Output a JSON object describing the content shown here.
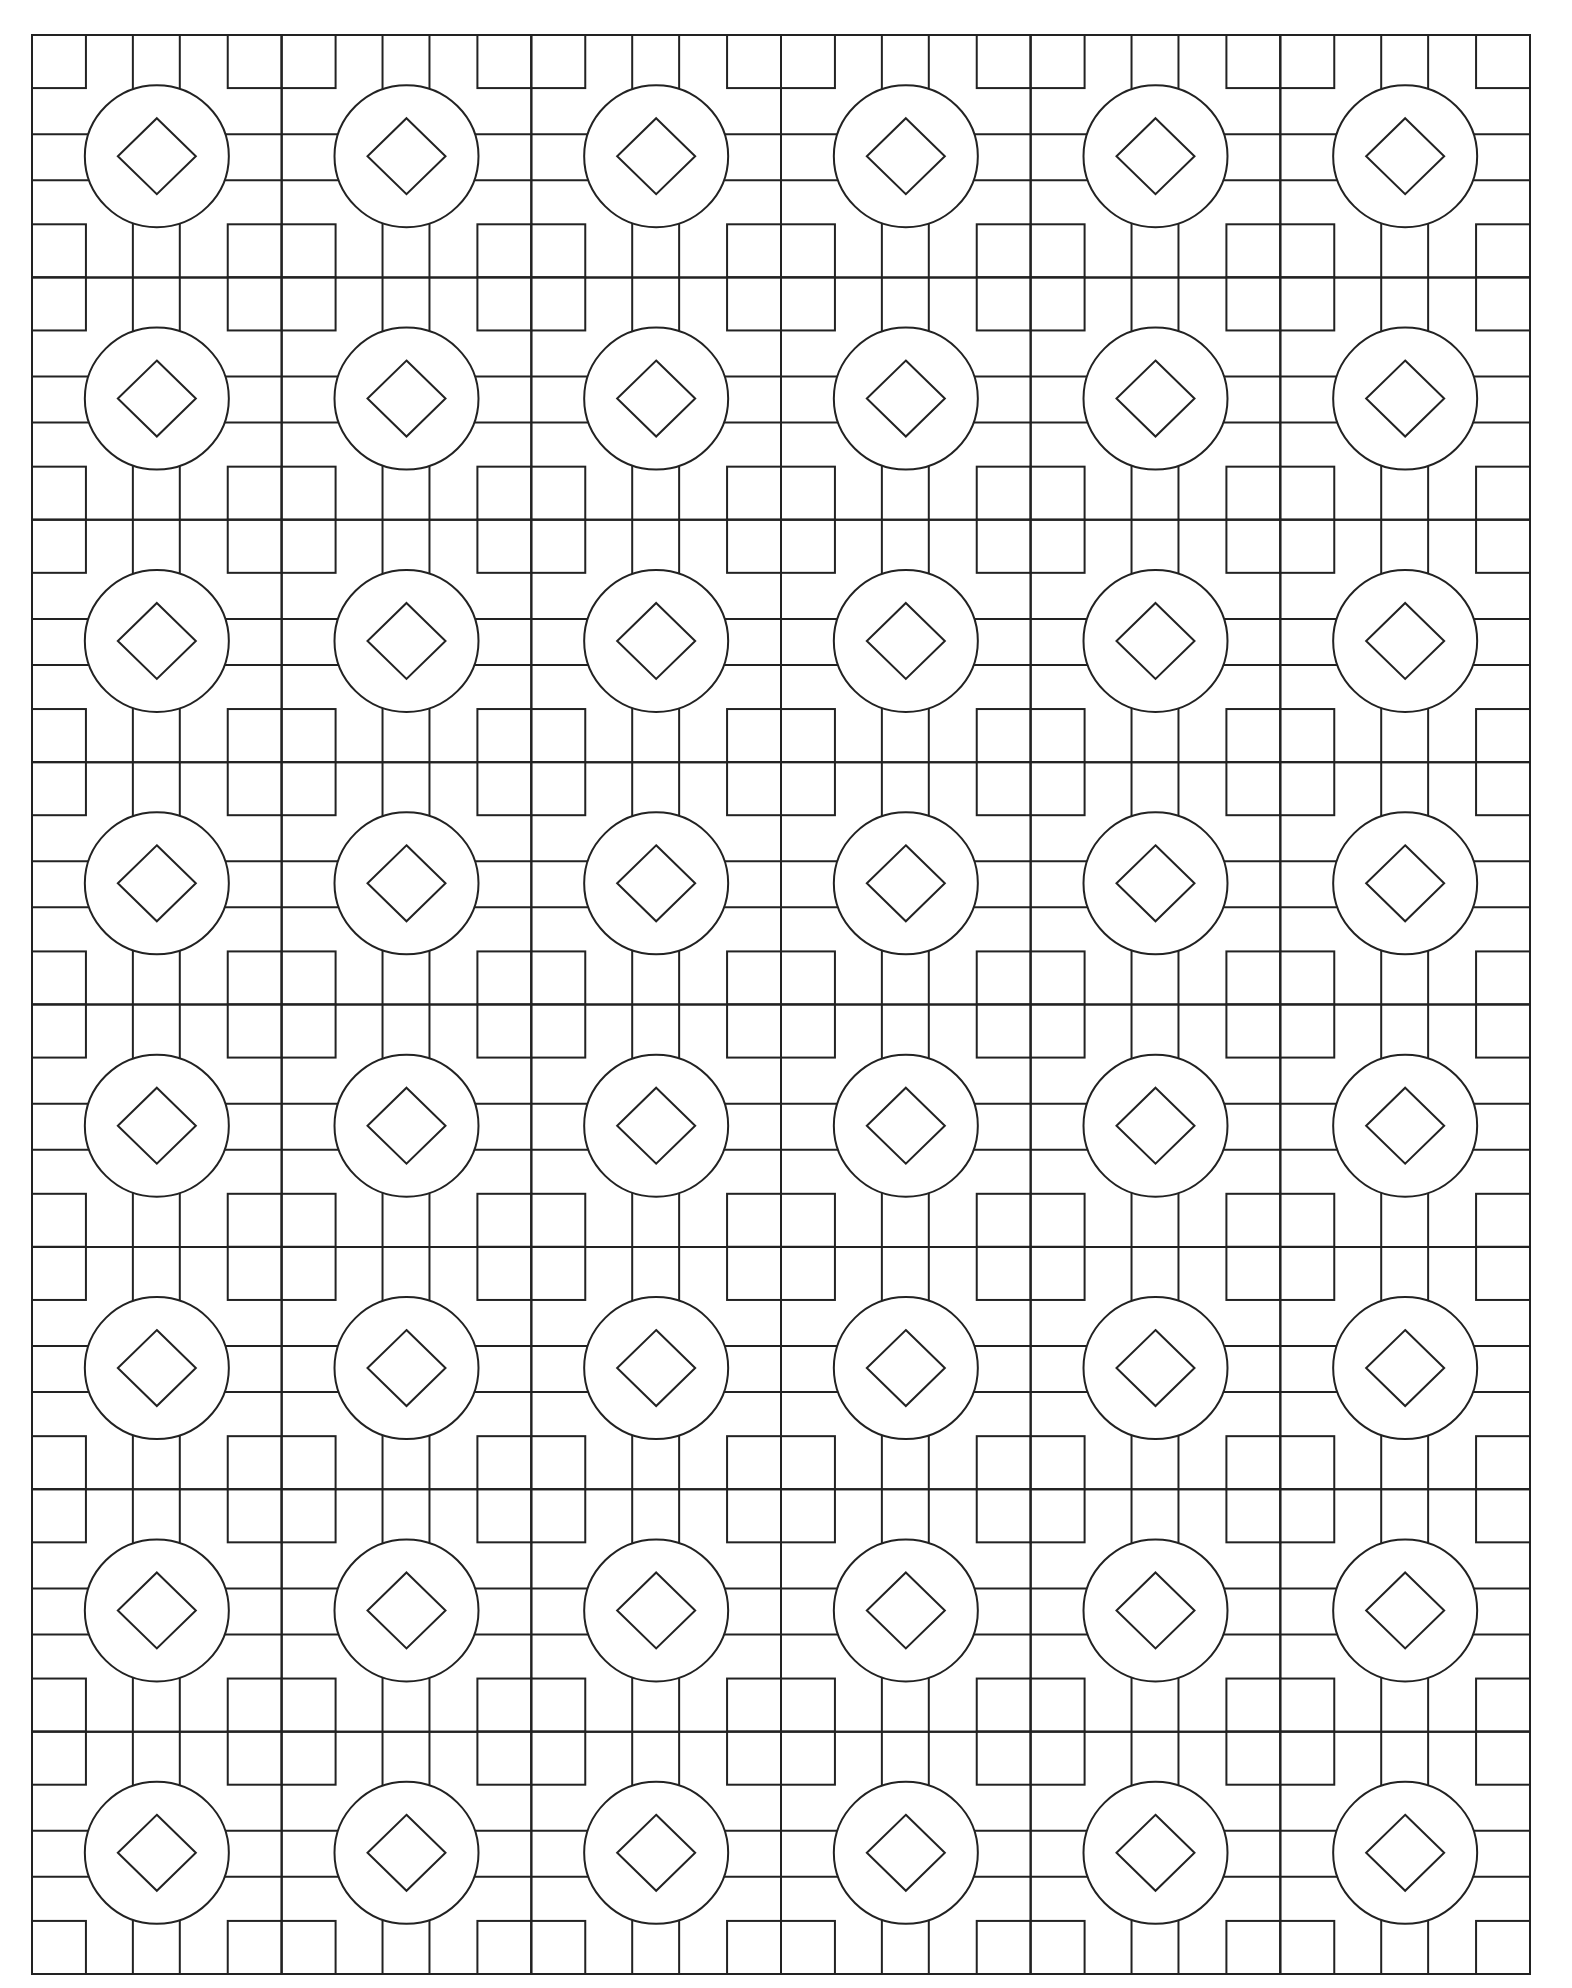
{
  "page": {
    "title": "Geometric coloring page: circles with diamonds on square lattice",
    "background": "#ffffff",
    "line_color": "#222222",
    "line_width": 2
  },
  "pattern": {
    "frame": {
      "x": 32,
      "y": 35,
      "width": 1498,
      "height": 1939
    },
    "columns": 6,
    "rows": 8,
    "tile": {
      "corner_square_w_ratio": 0.216,
      "corner_square_h_ratio": 0.219,
      "bar_inner_w_ratio": 0.404,
      "bar_inner_h_ratio": 0.409,
      "bar_outer_w_ratio": 0.592,
      "bar_outer_h_ratio": 0.599,
      "circle_rx": 72,
      "circle_ry": 71,
      "diamond_half_w": 39,
      "diamond_half_h": 38
    },
    "motifs": {
      "center": "circle-with-diamond",
      "corners": "square",
      "connectors": "double-line bars"
    }
  }
}
